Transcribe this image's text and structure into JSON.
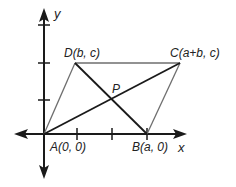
{
  "diagram": {
    "type": "coordinate-geometry",
    "colors": {
      "axis": "#1a1a1a",
      "parallelogram_sides": "#6e6e6e",
      "diagonals": "#1a1a1a",
      "label": "#222222"
    },
    "axes": {
      "x_label": "x",
      "y_label": "y"
    },
    "points": {
      "A": {
        "label": "A(0, 0)"
      },
      "B": {
        "label": "B(a, 0)"
      },
      "C": {
        "label": "C(a+b, c)"
      },
      "D": {
        "label": "D(b, c)"
      },
      "P": {
        "label": "P"
      }
    },
    "segments": [
      {
        "from": "A",
        "to": "B",
        "style": "axis"
      },
      {
        "from": "A",
        "to": "D",
        "style": "side"
      },
      {
        "from": "D",
        "to": "C",
        "style": "side"
      },
      {
        "from": "B",
        "to": "C",
        "style": "side"
      },
      {
        "from": "A",
        "to": "C",
        "style": "diagonal"
      },
      {
        "from": "D",
        "to": "B",
        "style": "diagonal"
      }
    ]
  }
}
